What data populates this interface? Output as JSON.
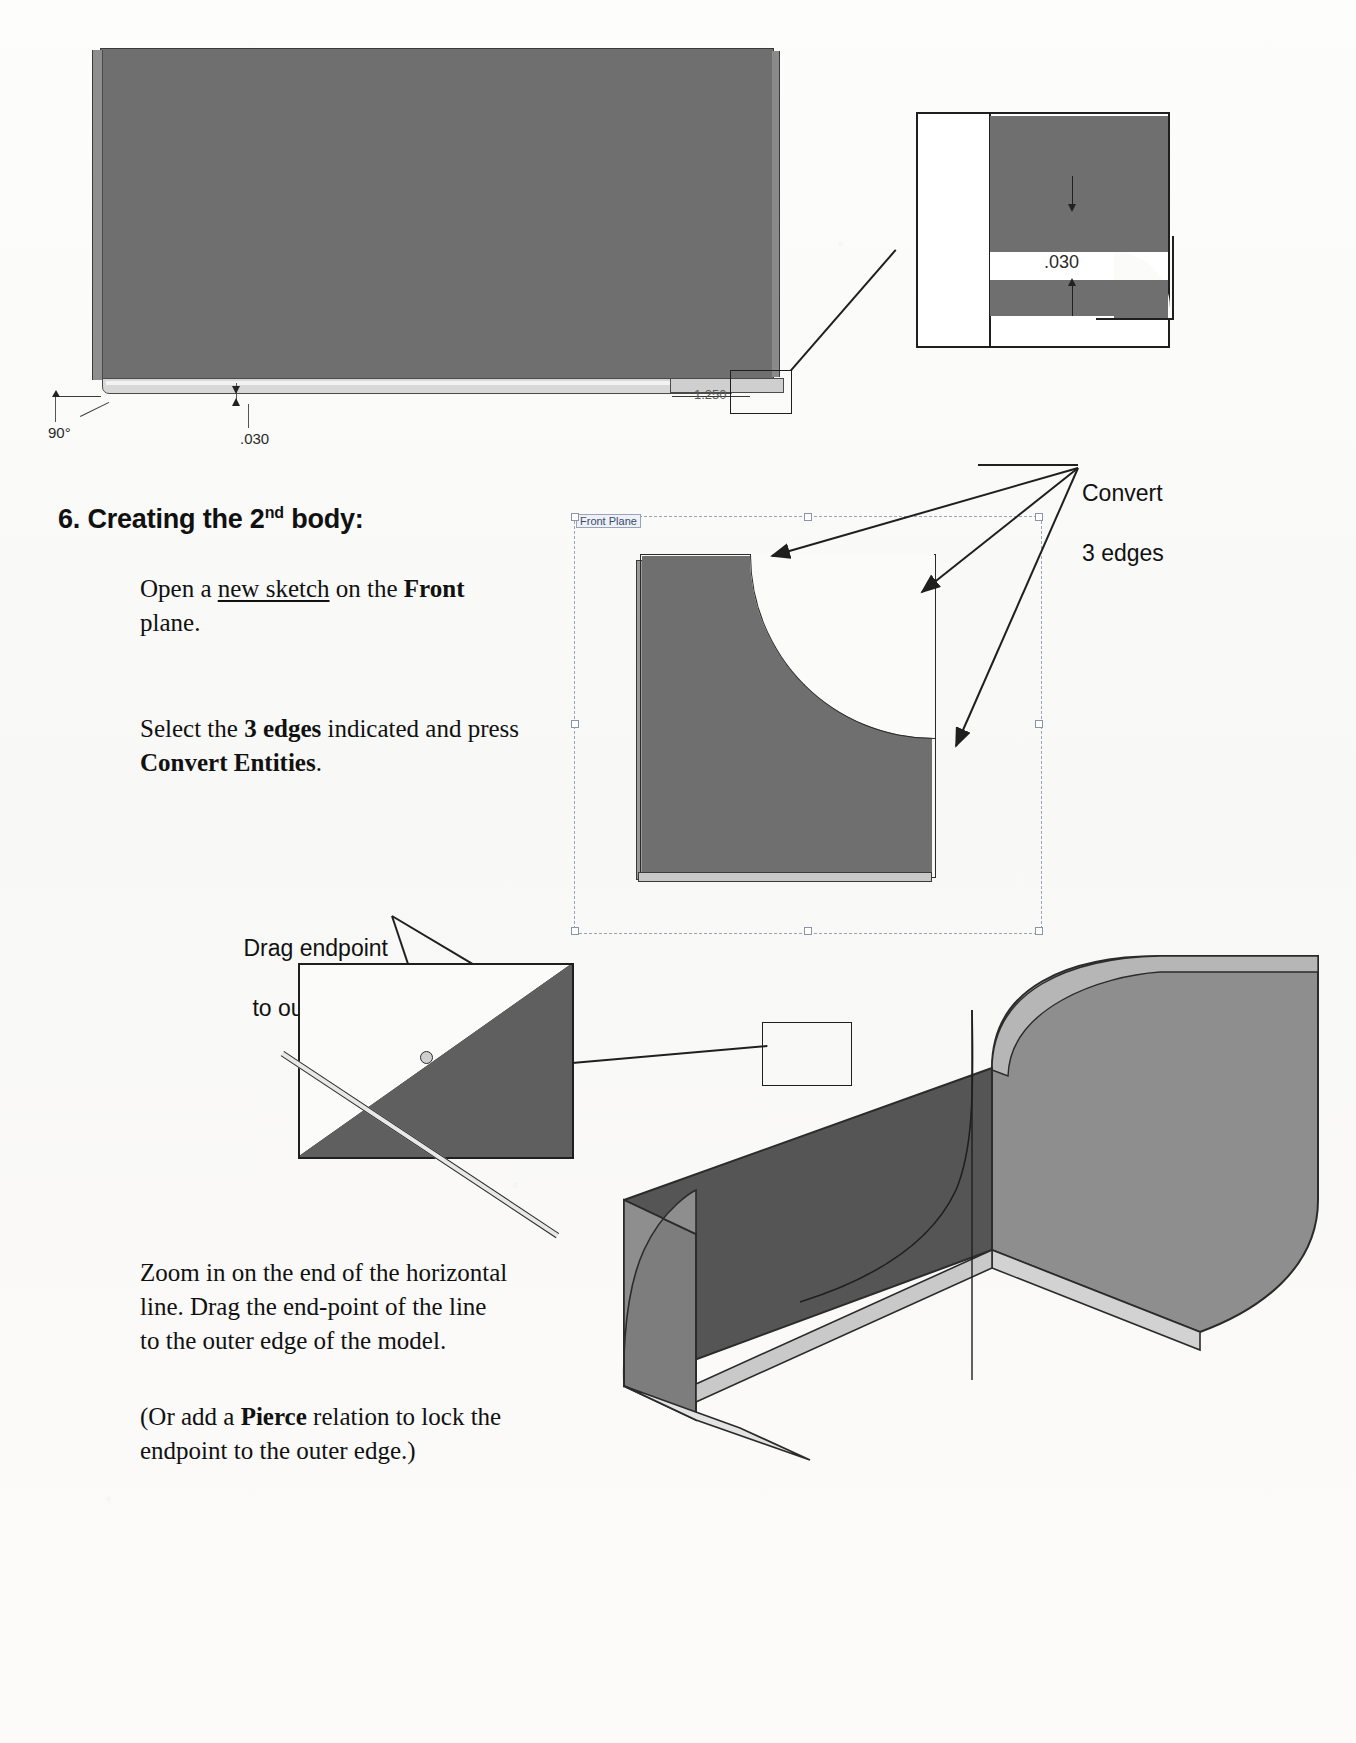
{
  "page": {
    "step_number": "6.",
    "step_title_main": "Creating the 2",
    "step_title_sup": "nd",
    "step_title_tail": " body:",
    "step_title_full": "6. Creating the 2nd body:"
  },
  "top_view": {
    "dimensions": [
      {
        "name": "angle",
        "value": "90°"
      },
      {
        "name": "thickness",
        "value": ".030"
      },
      {
        "name": "length",
        "value": "1.250"
      }
    ]
  },
  "detail_box": {
    "dimension_label": ".030",
    "arrow_down": "arrow-down-icon",
    "arrow_up": "arrow-up-icon"
  },
  "callouts": {
    "convert_edges_line1": "Convert",
    "convert_edges_line2": "3 edges",
    "drag_endpoint_line1": "Drag endpoint",
    "drag_endpoint_line2": "to outer edge"
  },
  "sketch_view": {
    "plane_label": "Front Plane"
  },
  "instructions": [
    {
      "id": "open-sketch",
      "segments": [
        {
          "text": "Open a ",
          "style": "normal"
        },
        {
          "text": "new sketch",
          "style": "underline"
        },
        {
          "text": " on the ",
          "style": "normal"
        },
        {
          "text": "Front",
          "style": "bold"
        },
        {
          "text": " plane.",
          "style": "normal"
        }
      ],
      "plain": "Open a new sketch on the Front plane."
    },
    {
      "id": "select-edges",
      "segments": [
        {
          "text": "Select the ",
          "style": "normal"
        },
        {
          "text": "3 edges",
          "style": "bold"
        },
        {
          "text": " indicated and press ",
          "style": "normal"
        },
        {
          "text": "Convert Entities",
          "style": "bold"
        },
        {
          "text": ".",
          "style": "normal"
        }
      ],
      "plain": "Select the 3 edges indicated and press Convert Entities."
    },
    {
      "id": "zoom-drag",
      "segments": [
        {
          "text": "Zoom in on the end of the horizontal line. Drag the end-point of the line to the outer edge of the model.",
          "style": "normal"
        }
      ],
      "plain": "Zoom in on the end of the horizontal line. Drag the end-point of the line to the outer edge of the model."
    },
    {
      "id": "pierce-relation",
      "segments": [
        {
          "text": "(Or add a ",
          "style": "normal"
        },
        {
          "text": "Pierce",
          "style": "bold"
        },
        {
          "text": " relation to lock the endpoint to the outer edge.)",
          "style": "normal"
        }
      ],
      "plain": "(Or add a Pierce relation to lock the endpoint to the outer edge.)"
    }
  ],
  "colors": {
    "paper": "#fbfbfa",
    "model_face_dark": "#6f6f6f",
    "model_face_mid": "#7a7a7a",
    "model_face_light": "#9a9a9a",
    "outline": "#2b2b2b",
    "text": "#111111",
    "plane_border": "#9aa3b8"
  }
}
